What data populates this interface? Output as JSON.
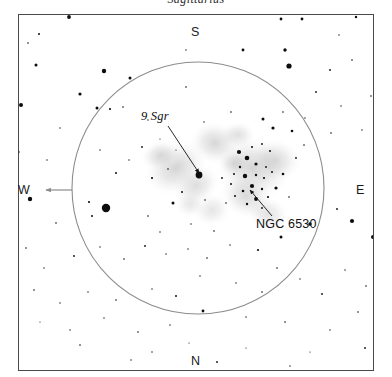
{
  "caption": {
    "text": "Sagittarius"
  },
  "frame": {
    "x": 18,
    "y": 14,
    "width": 356,
    "height": 357,
    "border_color": "#4a4a4a"
  },
  "compass": {
    "south": "S",
    "north": "N",
    "west": "W",
    "east": "E"
  },
  "field_circle": {
    "cx": 198,
    "cy": 188,
    "r": 126,
    "color": "#8c8c8c"
  },
  "direction_arrow": {
    "name": "west-direction-arrow",
    "x1": 72,
    "y1": 190,
    "x2": 46,
    "y2": 190,
    "color": "#8c8c8c"
  },
  "annotations": [
    {
      "id": "9sgr",
      "label": "9 Sgr",
      "italic": true,
      "leader": {
        "x1": 168,
        "y1": 126,
        "x2": 199,
        "y2": 173
      }
    },
    {
      "id": "ngc6530",
      "label": "NGC 6530",
      "italic": false,
      "leader": {
        "x1": 272,
        "y1": 216,
        "x2": 250,
        "y2": 190
      }
    }
  ],
  "chart_data": {
    "type": "scatter",
    "title": "Sagittarius",
    "xlabel": "",
    "ylabel": "",
    "xlim": [
      18,
      374
    ],
    "ylim": [
      14,
      371
    ],
    "grid": false,
    "legend": null,
    "axis_directions": {
      "top": "S",
      "bottom": "N",
      "left": "W",
      "right": "E"
    },
    "objects": [
      {
        "name": "9 Sgr",
        "x": 199,
        "y": 175,
        "type": "star",
        "mag_size": 4.6
      },
      {
        "name": "NGC 6530",
        "x": 252,
        "y": 186,
        "type": "open-cluster"
      }
    ],
    "nebulosity": [
      {
        "cx": 176,
        "cy": 168,
        "rx": 34,
        "ry": 26,
        "rot": -30,
        "opacity": 0.3
      },
      {
        "cx": 160,
        "cy": 155,
        "rx": 20,
        "ry": 15,
        "rot": -20,
        "opacity": 0.26
      },
      {
        "cx": 196,
        "cy": 186,
        "rx": 26,
        "ry": 20,
        "rot": -35,
        "opacity": 0.24
      },
      {
        "cx": 215,
        "cy": 143,
        "rx": 26,
        "ry": 22,
        "rot": 10,
        "opacity": 0.28
      },
      {
        "cx": 238,
        "cy": 135,
        "rx": 18,
        "ry": 14,
        "rot": 0,
        "opacity": 0.22
      },
      {
        "cx": 253,
        "cy": 168,
        "rx": 40,
        "ry": 32,
        "rot": 20,
        "opacity": 0.3
      },
      {
        "cx": 276,
        "cy": 160,
        "rx": 26,
        "ry": 22,
        "rot": 15,
        "opacity": 0.24
      },
      {
        "cx": 246,
        "cy": 196,
        "rx": 28,
        "ry": 22,
        "rot": 25,
        "opacity": 0.26
      },
      {
        "cx": 268,
        "cy": 214,
        "rx": 22,
        "ry": 18,
        "rot": 20,
        "opacity": 0.2
      },
      {
        "cx": 212,
        "cy": 210,
        "rx": 20,
        "ry": 17,
        "rot": -15,
        "opacity": 0.18
      },
      {
        "cx": 190,
        "cy": 205,
        "rx": 16,
        "ry": 13,
        "rot": 0,
        "opacity": 0.16
      },
      {
        "cx": 234,
        "cy": 163,
        "rx": 16,
        "ry": 13,
        "rot": 0,
        "opacity": 0.2
      }
    ],
    "stars": [
      {
        "x": 69,
        "y": 17,
        "r": 1.9
      },
      {
        "x": 281,
        "y": 19,
        "r": 1.4
      },
      {
        "x": 302,
        "y": 19,
        "r": 1.4
      },
      {
        "x": 356,
        "y": 17,
        "r": 1.2
      },
      {
        "x": 39,
        "y": 34,
        "r": 1.0
      },
      {
        "x": 28,
        "y": 43,
        "r": 0.8
      },
      {
        "x": 339,
        "y": 35,
        "r": 0.7
      },
      {
        "x": 186,
        "y": 50,
        "r": 0.7
      },
      {
        "x": 243,
        "y": 50,
        "r": 1.4
      },
      {
        "x": 285,
        "y": 50,
        "r": 1.7
      },
      {
        "x": 36,
        "y": 65,
        "r": 1.5
      },
      {
        "x": 104,
        "y": 71,
        "r": 2.2
      },
      {
        "x": 130,
        "y": 78,
        "r": 1.5
      },
      {
        "x": 289,
        "y": 66,
        "r": 2.6
      },
      {
        "x": 330,
        "y": 70,
        "r": 0.9
      },
      {
        "x": 352,
        "y": 60,
        "r": 0.8
      },
      {
        "x": 21,
        "y": 105,
        "r": 2.0
      },
      {
        "x": 80,
        "y": 94,
        "r": 1.6
      },
      {
        "x": 97,
        "y": 108,
        "r": 1.5
      },
      {
        "x": 110,
        "y": 109,
        "r": 1.1
      },
      {
        "x": 123,
        "y": 107,
        "r": 0.8
      },
      {
        "x": 186,
        "y": 87,
        "r": 0.8
      },
      {
        "x": 316,
        "y": 92,
        "r": 0.9
      },
      {
        "x": 341,
        "y": 106,
        "r": 0.7
      },
      {
        "x": 371,
        "y": 96,
        "r": 0.8
      },
      {
        "x": 60,
        "y": 128,
        "r": 0.7
      },
      {
        "x": 148,
        "y": 120,
        "r": 0.7
      },
      {
        "x": 160,
        "y": 139,
        "r": 0.6
      },
      {
        "x": 142,
        "y": 147,
        "r": 0.9
      },
      {
        "x": 129,
        "y": 160,
        "r": 0.7
      },
      {
        "x": 176,
        "y": 150,
        "r": 0.6
      },
      {
        "x": 204,
        "y": 122,
        "r": 0.7
      },
      {
        "x": 231,
        "y": 112,
        "r": 0.8
      },
      {
        "x": 263,
        "y": 119,
        "r": 1.5
      },
      {
        "x": 283,
        "y": 112,
        "r": 0.8
      },
      {
        "x": 305,
        "y": 118,
        "r": 0.7
      },
      {
        "x": 331,
        "y": 133,
        "r": 0.8
      },
      {
        "x": 362,
        "y": 130,
        "r": 0.7
      },
      {
        "x": 19,
        "y": 152,
        "r": 0.8
      },
      {
        "x": 47,
        "y": 160,
        "r": 0.7
      },
      {
        "x": 100,
        "y": 150,
        "r": 0.7
      },
      {
        "x": 116,
        "y": 173,
        "r": 1.0
      },
      {
        "x": 152,
        "y": 178,
        "r": 1.1
      },
      {
        "x": 168,
        "y": 169,
        "r": 0.8
      },
      {
        "x": 199,
        "y": 175,
        "r": 3.4
      },
      {
        "x": 182,
        "y": 192,
        "r": 1.0
      },
      {
        "x": 173,
        "y": 203,
        "r": 1.5
      },
      {
        "x": 205,
        "y": 200,
        "r": 0.8
      },
      {
        "x": 222,
        "y": 178,
        "r": 0.9
      },
      {
        "x": 231,
        "y": 184,
        "r": 1.0
      },
      {
        "x": 239,
        "y": 152,
        "r": 2.1
      },
      {
        "x": 252,
        "y": 147,
        "r": 1.0
      },
      {
        "x": 262,
        "y": 144,
        "r": 0.9
      },
      {
        "x": 270,
        "y": 151,
        "r": 1.0
      },
      {
        "x": 247,
        "y": 158,
        "r": 2.3
      },
      {
        "x": 256,
        "y": 164,
        "r": 1.6
      },
      {
        "x": 266,
        "y": 167,
        "r": 0.9
      },
      {
        "x": 240,
        "y": 167,
        "r": 1.2
      },
      {
        "x": 234,
        "y": 174,
        "r": 1.0
      },
      {
        "x": 245,
        "y": 176,
        "r": 2.2
      },
      {
        "x": 256,
        "y": 175,
        "r": 1.2
      },
      {
        "x": 264,
        "y": 178,
        "r": 1.1
      },
      {
        "x": 272,
        "y": 172,
        "r": 1.0
      },
      {
        "x": 252,
        "y": 186,
        "r": 2.1
      },
      {
        "x": 262,
        "y": 189,
        "r": 1.2
      },
      {
        "x": 243,
        "y": 191,
        "r": 1.3
      },
      {
        "x": 235,
        "y": 196,
        "r": 1.0
      },
      {
        "x": 256,
        "y": 199,
        "r": 1.9
      },
      {
        "x": 268,
        "y": 197,
        "r": 1.1
      },
      {
        "x": 247,
        "y": 204,
        "r": 1.2
      },
      {
        "x": 262,
        "y": 208,
        "r": 0.9
      },
      {
        "x": 276,
        "y": 188,
        "r": 1.6
      },
      {
        "x": 283,
        "y": 174,
        "r": 1.3
      },
      {
        "x": 289,
        "y": 197,
        "r": 0.8
      },
      {
        "x": 226,
        "y": 203,
        "r": 0.8
      },
      {
        "x": 273,
        "y": 128,
        "r": 1.6
      },
      {
        "x": 292,
        "y": 131,
        "r": 1.3
      },
      {
        "x": 304,
        "y": 145,
        "r": 0.8
      },
      {
        "x": 296,
        "y": 158,
        "r": 0.9
      },
      {
        "x": 106,
        "y": 208,
        "r": 4.2
      },
      {
        "x": 89,
        "y": 202,
        "r": 1.1
      },
      {
        "x": 92,
        "y": 216,
        "r": 1.0
      },
      {
        "x": 30,
        "y": 199,
        "r": 2.2
      },
      {
        "x": 56,
        "y": 223,
        "r": 0.8
      },
      {
        "x": 148,
        "y": 216,
        "r": 0.8
      },
      {
        "x": 160,
        "y": 232,
        "r": 0.7
      },
      {
        "x": 191,
        "y": 224,
        "r": 0.7
      },
      {
        "x": 214,
        "y": 231,
        "r": 0.8
      },
      {
        "x": 310,
        "y": 224,
        "r": 1.7
      },
      {
        "x": 337,
        "y": 209,
        "r": 0.9
      },
      {
        "x": 352,
        "y": 221,
        "r": 2.1
      },
      {
        "x": 373,
        "y": 237,
        "r": 2.0
      },
      {
        "x": 281,
        "y": 237,
        "r": 1.5
      },
      {
        "x": 258,
        "y": 250,
        "r": 1.1
      },
      {
        "x": 277,
        "y": 268,
        "r": 0.8
      },
      {
        "x": 230,
        "y": 245,
        "r": 0.7
      },
      {
        "x": 207,
        "y": 258,
        "r": 0.8
      },
      {
        "x": 188,
        "y": 249,
        "r": 0.7
      },
      {
        "x": 166,
        "y": 254,
        "r": 0.7
      },
      {
        "x": 145,
        "y": 246,
        "r": 0.9
      },
      {
        "x": 124,
        "y": 259,
        "r": 0.8
      },
      {
        "x": 100,
        "y": 247,
        "r": 0.7
      },
      {
        "x": 74,
        "y": 256,
        "r": 0.9
      },
      {
        "x": 44,
        "y": 268,
        "r": 0.7
      },
      {
        "x": 26,
        "y": 248,
        "r": 0.8
      },
      {
        "x": 200,
        "y": 276,
        "r": 0.7
      },
      {
        "x": 236,
        "y": 283,
        "r": 0.7
      },
      {
        "x": 262,
        "y": 292,
        "r": 0.8
      },
      {
        "x": 300,
        "y": 279,
        "r": 0.7
      },
      {
        "x": 322,
        "y": 294,
        "r": 0.9
      },
      {
        "x": 345,
        "y": 270,
        "r": 0.7
      },
      {
        "x": 366,
        "y": 286,
        "r": 0.8
      },
      {
        "x": 176,
        "y": 296,
        "r": 1.0
      },
      {
        "x": 152,
        "y": 289,
        "r": 0.7
      },
      {
        "x": 116,
        "y": 300,
        "r": 0.8
      },
      {
        "x": 88,
        "y": 292,
        "r": 0.7
      },
      {
        "x": 60,
        "y": 303,
        "r": 0.7
      },
      {
        "x": 34,
        "y": 290,
        "r": 0.8
      },
      {
        "x": 203,
        "y": 311,
        "r": 1.4
      },
      {
        "x": 246,
        "y": 317,
        "r": 0.7
      },
      {
        "x": 285,
        "y": 322,
        "r": 0.8
      },
      {
        "x": 330,
        "y": 330,
        "r": 0.7
      },
      {
        "x": 358,
        "y": 312,
        "r": 0.8
      },
      {
        "x": 170,
        "y": 325,
        "r": 0.7
      },
      {
        "x": 138,
        "y": 332,
        "r": 0.8
      },
      {
        "x": 104,
        "y": 318,
        "r": 0.7
      },
      {
        "x": 70,
        "y": 330,
        "r": 0.7
      },
      {
        "x": 40,
        "y": 322,
        "r": 0.6
      },
      {
        "x": 80,
        "y": 345,
        "r": 0.8
      },
      {
        "x": 152,
        "y": 352,
        "r": 0.7
      },
      {
        "x": 131,
        "y": 360,
        "r": 0.7
      },
      {
        "x": 217,
        "y": 362,
        "r": 0.9
      },
      {
        "x": 290,
        "y": 366,
        "r": 0.7
      },
      {
        "x": 365,
        "y": 348,
        "r": 0.9
      },
      {
        "x": 246,
        "y": 348,
        "r": 0.6
      },
      {
        "x": 310,
        "y": 352,
        "r": 0.6
      },
      {
        "x": 189,
        "y": 343,
        "r": 0.6
      }
    ]
  }
}
